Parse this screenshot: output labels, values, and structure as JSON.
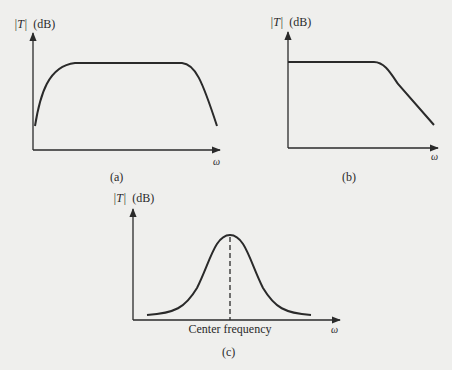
{
  "figure": {
    "panels": [
      {
        "id": "a",
        "caption": "(a)",
        "ylabel_abs": "|T|",
        "ylabel_unit": "(dB)",
        "xlabel": "ω",
        "description": "band-pass (wide) response"
      },
      {
        "id": "b",
        "caption": "(b)",
        "ylabel_abs": "|T|",
        "ylabel_unit": "(dB)",
        "xlabel": "ω",
        "description": "low-pass response"
      },
      {
        "id": "c",
        "caption": "(c)",
        "ylabel_abs": "|T|",
        "ylabel_unit": "(dB)",
        "xlabel": "ω",
        "marker_label": "Center frequency",
        "description": "narrow band-pass response"
      }
    ],
    "colors": {
      "background": "#efefed",
      "ink": "#2a2a2a"
    }
  }
}
